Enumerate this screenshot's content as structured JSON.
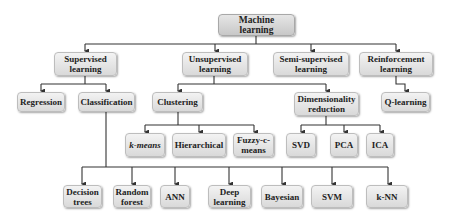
{
  "diagram": {
    "root": {
      "label": "Machine learning"
    },
    "categories": [
      {
        "label": "Supervised\nlearning"
      },
      {
        "label": "Unsupervised\nlearning"
      },
      {
        "label": "Semi-supervised\nlearning"
      },
      {
        "label": "Reinforcement\nlearning"
      }
    ],
    "supervised_children": [
      {
        "label": "Regression"
      },
      {
        "label": "Classification"
      }
    ],
    "unsupervised_children": [
      {
        "label": "Clustering"
      },
      {
        "label": "Dimensionality\nreduction"
      }
    ],
    "reinforcement_children": [
      {
        "label": "Q-learning"
      }
    ],
    "clustering_methods": [
      {
        "label": "k-means"
      },
      {
        "label": "Hierarchical"
      },
      {
        "label": "Fuzzy-c-\nmeans"
      }
    ],
    "dimensionality_methods": [
      {
        "label": "SVD"
      },
      {
        "label": "PCA"
      },
      {
        "label": "ICA"
      }
    ],
    "classification_methods": [
      {
        "label": "Decision\ntrees"
      },
      {
        "label": "Random\nforest"
      },
      {
        "label": "ANN"
      },
      {
        "label": "Deep\nlearning"
      },
      {
        "label": "Bayesian"
      },
      {
        "label": "SVM"
      },
      {
        "label": "k-NN"
      }
    ],
    "colors": {
      "node_fill_top": "#f3f3f3",
      "node_fill_bottom": "#d9d9d9",
      "edge": "#333333",
      "text": "#222222"
    }
  }
}
